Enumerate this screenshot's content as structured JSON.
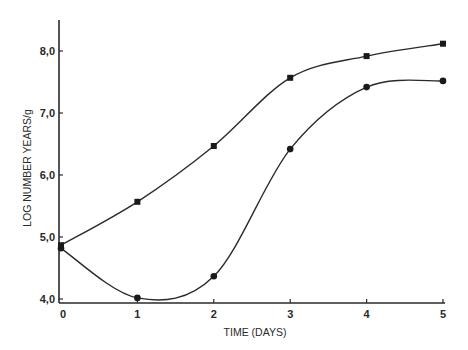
{
  "chart_data": {
    "type": "line",
    "title": "",
    "xlabel": "TIME (DAYS)",
    "ylabel": "LOG NUMBER YEARS/g",
    "x": [
      0,
      1,
      2,
      3,
      4,
      5
    ],
    "xlim": [
      0,
      5
    ],
    "ylim": [
      4.0,
      8.5
    ],
    "x_ticks": [
      "0",
      "1",
      "2",
      "3",
      "4",
      "5"
    ],
    "y_ticks": [
      "4,0",
      "5,0",
      "6,0",
      "7,0",
      "8,0"
    ],
    "y_tick_values": [
      4.0,
      5.0,
      6.0,
      7.0,
      8.0
    ],
    "grid": false,
    "legend": null,
    "series": [
      {
        "name": "squares",
        "marker": "square",
        "values": [
          4.9,
          5.6,
          6.5,
          7.6,
          7.95,
          8.15
        ]
      },
      {
        "name": "circles",
        "marker": "circle",
        "values": [
          4.85,
          4.05,
          4.4,
          6.45,
          7.45,
          7.55
        ]
      }
    ],
    "colors": {
      "line": "#2a2a2a",
      "marker": "#1a1a1a",
      "background": "#ffffff"
    }
  }
}
